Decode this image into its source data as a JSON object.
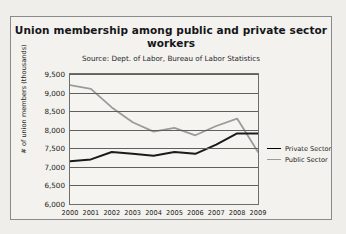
{
  "chart_data": {
    "type": "line",
    "title": "Union membership among public and private sector workers",
    "subtitle": "Source: Dept. of Labor, Bureau of Labor Statistics",
    "xlabel": "",
    "ylabel": "# of union members (thousands)",
    "categories": [
      "2000",
      "2001",
      "2002",
      "2003",
      "2004",
      "2005",
      "2006",
      "2007",
      "2008",
      "2009"
    ],
    "ylim": [
      6000,
      9500
    ],
    "ytick_step": 500,
    "yticks": [
      "9,500",
      "9,000",
      "8,500",
      "8,000",
      "7,500",
      "7,000",
      "6,500",
      "6,000"
    ],
    "ytick_values": [
      9500,
      9000,
      8500,
      8000,
      7500,
      7000,
      6500,
      6000
    ],
    "grid": true,
    "legend_position": "right",
    "series": [
      {
        "name": "Private Sector",
        "color": "#1a1a1a",
        "values": [
          7150,
          7200,
          7400,
          7350,
          7300,
          7400,
          7350,
          7600,
          7900,
          7900
        ]
      },
      {
        "name": "Public Sector",
        "color": "#9b9b99",
        "values": [
          9200,
          9100,
          8600,
          8200,
          7950,
          8050,
          7850,
          8100,
          8300,
          7400
        ]
      }
    ]
  },
  "legend": {
    "items": [
      {
        "label": "Private Sector"
      },
      {
        "label": "Public Sector"
      }
    ]
  },
  "colors": {
    "private": "#1a1a1a",
    "public": "#9b9b99",
    "grid": "#5f5f5e",
    "frame": "#8a8a88",
    "background": "#f3f2ee"
  }
}
